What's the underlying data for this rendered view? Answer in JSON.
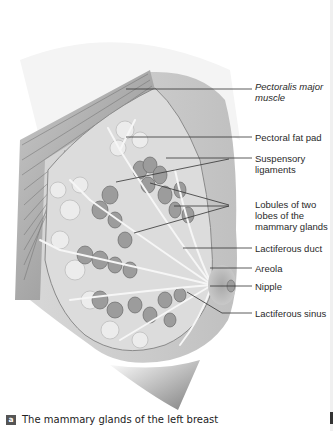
{
  "figure": {
    "labels": [
      {
        "id": "pectoralis",
        "text": "Pectoralis major muscle",
        "italic": true
      },
      {
        "id": "fat_pad",
        "text": "Pectoral fat pad",
        "italic": false
      },
      {
        "id": "suspensory",
        "text": "Suspensory ligaments",
        "italic": false
      },
      {
        "id": "lobules",
        "text": "Lobules of two lobes of the mammary glands",
        "italic": false
      },
      {
        "id": "duct",
        "text": "Lactiferous duct",
        "italic": false
      },
      {
        "id": "areola",
        "text": "Areola",
        "italic": false
      },
      {
        "id": "nipple",
        "text": "Nipple",
        "italic": false
      },
      {
        "id": "sinus",
        "text": "Lactiferous sinus",
        "italic": false
      }
    ]
  },
  "caption": {
    "badge": "a",
    "text": "The mammary glands of the left breast"
  },
  "colors": {
    "tissue_light": "#e2e2e2",
    "tissue_mid": "#b8b8b8",
    "tissue_dark": "#7c7c7c",
    "lobule": "#9a9a9a",
    "leader_line": "#333333"
  }
}
